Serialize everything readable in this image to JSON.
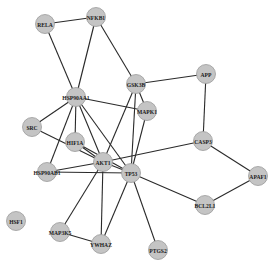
{
  "diagram": {
    "type": "network",
    "node_color": "#c4c4c4",
    "edge_color": "#2a2a2a",
    "background": "#ffffff",
    "nodes": [
      {
        "id": "RELA",
        "label": "RELA",
        "x": 45,
        "y": 24
      },
      {
        "id": "NFKB1",
        "label": "NFKB1",
        "x": 96,
        "y": 17
      },
      {
        "id": "HSP90AA1",
        "label": "HSP90AA1",
        "x": 76,
        "y": 97
      },
      {
        "id": "GSK3B",
        "label": "GSK3B",
        "x": 136,
        "y": 84
      },
      {
        "id": "APP",
        "label": "APP",
        "x": 206,
        "y": 74
      },
      {
        "id": "MAPK1",
        "label": "MAPK1",
        "x": 147,
        "y": 111
      },
      {
        "id": "SRC",
        "label": "SRC",
        "x": 32,
        "y": 127
      },
      {
        "id": "HIF1A",
        "label": "HIF1A",
        "x": 75,
        "y": 142
      },
      {
        "id": "AKT1",
        "label": "AKT1",
        "x": 103,
        "y": 162
      },
      {
        "id": "TP53",
        "label": "TP53",
        "x": 131,
        "y": 173
      },
      {
        "id": "CASP3",
        "label": "CASP3",
        "x": 203,
        "y": 141
      },
      {
        "id": "HSP90AB1",
        "label": "HSP90AB1",
        "x": 47,
        "y": 172
      },
      {
        "id": "APAF1",
        "label": "APAF1",
        "x": 258,
        "y": 176
      },
      {
        "id": "BCL2L1",
        "label": "BCL2L1",
        "x": 205,
        "y": 205
      },
      {
        "id": "HSF1",
        "label": "HSF1",
        "x": 16,
        "y": 221
      },
      {
        "id": "MAP3K5",
        "label": "MAP3K5",
        "x": 60,
        "y": 232
      },
      {
        "id": "YWHAZ",
        "label": "YWHAZ",
        "x": 101,
        "y": 244
      },
      {
        "id": "PTGS2",
        "label": "PTGS2",
        "x": 158,
        "y": 250
      }
    ],
    "edges": [
      [
        "RELA",
        "NFKB1"
      ],
      [
        "RELA",
        "HSP90AA1"
      ],
      [
        "NFKB1",
        "HSP90AA1"
      ],
      [
        "NFKB1",
        "GSK3B"
      ],
      [
        "GSK3B",
        "APP"
      ],
      [
        "GSK3B",
        "MAPK1"
      ],
      [
        "GSK3B",
        "AKT1"
      ],
      [
        "GSK3B",
        "TP53"
      ],
      [
        "APP",
        "CASP3"
      ],
      [
        "HSP90AA1",
        "MAPK1"
      ],
      [
        "HSP90AA1",
        "SRC"
      ],
      [
        "HSP90AA1",
        "HIF1A"
      ],
      [
        "HSP90AA1",
        "HSP90AB1"
      ],
      [
        "HSP90AA1",
        "AKT1"
      ],
      [
        "HSP90AA1",
        "TP53"
      ],
      [
        "MAPK1",
        "TP53"
      ],
      [
        "SRC",
        "AKT1"
      ],
      [
        "HIF1A",
        "AKT1"
      ],
      [
        "HIF1A",
        "TP53"
      ],
      [
        "HSP90AB1",
        "AKT1"
      ],
      [
        "HSP90AB1",
        "TP53"
      ],
      [
        "AKT1",
        "TP53"
      ],
      [
        "AKT1",
        "CASP3"
      ],
      [
        "AKT1",
        "MAP3K5"
      ],
      [
        "AKT1",
        "YWHAZ"
      ],
      [
        "TP53",
        "BCL2L1"
      ],
      [
        "TP53",
        "YWHAZ"
      ],
      [
        "TP53",
        "PTGS2"
      ],
      [
        "CASP3",
        "APAF1"
      ],
      [
        "APAF1",
        "BCL2L1"
      ],
      [
        "MAP3K5",
        "YWHAZ"
      ]
    ]
  }
}
